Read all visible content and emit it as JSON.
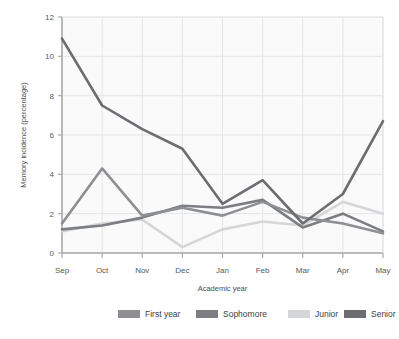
{
  "chart_data": {
    "type": "line",
    "title": "",
    "xlabel": "Academic year",
    "ylabel": "Memory incidence (percentage)",
    "categories": [
      "Sep",
      "Oct",
      "Nov",
      "Dec",
      "Jan",
      "Feb",
      "Mar",
      "Apr",
      "May"
    ],
    "x_tick_labels": [
      "Sep",
      "Oct",
      "Nov",
      "Dec",
      "Jan",
      "Feb",
      "Mar",
      "Apr",
      "May"
    ],
    "y_tick_labels": [
      "0",
      "2",
      "4",
      "6",
      "8",
      "10",
      "12"
    ],
    "y_ticks": [
      0,
      2,
      4,
      6,
      8,
      10,
      12
    ],
    "ylim": [
      0,
      12
    ],
    "grid": true,
    "legend_position": "bottom",
    "series": [
      {
        "name": "First year",
        "color": "#8d8f92",
        "values": [
          1.5,
          4.3,
          1.9,
          2.3,
          1.9,
          2.6,
          1.8,
          1.5,
          1.0
        ]
      },
      {
        "name": "Sophomore",
        "color": "#7c7e81",
        "values": [
          1.2,
          1.4,
          1.8,
          2.4,
          2.3,
          2.7,
          1.3,
          2.0,
          1.1
        ]
      },
      {
        "name": "Junior",
        "color": "#d5d6d8",
        "values": [
          1.1,
          1.5,
          1.7,
          0.3,
          1.2,
          1.6,
          1.4,
          2.6,
          2.0
        ]
      },
      {
        "name": "Senior",
        "color": "#6b6d70",
        "values": [
          10.9,
          7.5,
          6.3,
          5.3,
          2.5,
          3.7,
          1.5,
          3.0,
          6.7
        ]
      }
    ],
    "plot_bg": "#fafafa",
    "grid_color": "#e4e5e7",
    "axis_color": "#a9aaac",
    "page_bg": "#ffffff"
  },
  "legend": {
    "items": [
      {
        "label": "First year"
      },
      {
        "label": "Sophomore"
      },
      {
        "label": "Junior"
      },
      {
        "label": "Senior"
      }
    ]
  }
}
